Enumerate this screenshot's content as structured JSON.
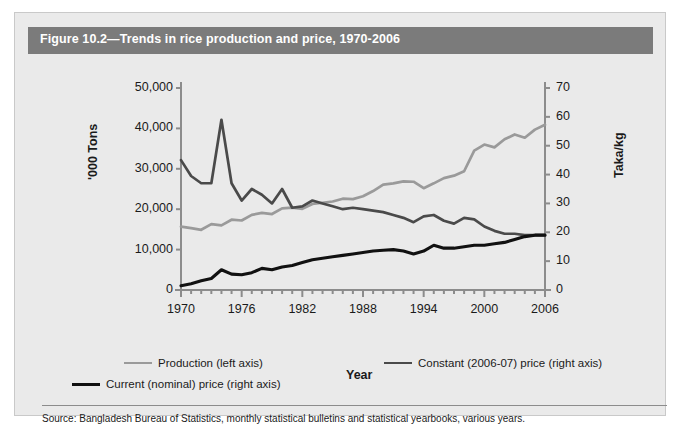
{
  "figure": {
    "title": "Figure 10.2—Trends in rice production and price, 1970-2006",
    "source": "Source: Bangladesh Bureau of Statistics, monthly statistical bulletins and statistical yearbooks, various years."
  },
  "legend": {
    "production": "Production (left axis)",
    "constant": "Constant (2006-07) price (right axis)",
    "current": "Current (nominal) price (right axis)"
  },
  "colors": {
    "title_bar": "#7b7b7b",
    "panel_bg": "#eaeaea",
    "production": "#9a9a9a",
    "constant": "#4a4a4a",
    "current": "#111111",
    "axis": "#8c8c8c"
  },
  "chart_data": {
    "type": "line",
    "title": "Figure 10.2—Trends in rice production and price, 1970-2006",
    "xlabel": "Year",
    "ylabel": "'000 Tons",
    "ylabel_right": "Taka/kg",
    "grid": false,
    "legend_position": "bottom",
    "xlim": [
      1970,
      2006
    ],
    "ylim": [
      0,
      50000
    ],
    "ylim_right": [
      0,
      70
    ],
    "xticks": [
      1970,
      1976,
      1982,
      1988,
      1994,
      2000,
      2006
    ],
    "xtick_labels": [
      "1970",
      "1976",
      "1982",
      "1988",
      "1994",
      "2000",
      "2006"
    ],
    "yticks": [
      0,
      10000,
      20000,
      30000,
      40000,
      50000
    ],
    "ytick_labels": [
      "0",
      "10,000",
      "20,000",
      "30,000",
      "40,000",
      "50,000"
    ],
    "yticks_right": [
      0,
      10,
      20,
      30,
      40,
      50,
      60,
      70
    ],
    "ytick_labels_right": [
      "0",
      "10",
      "20",
      "30",
      "40",
      "50",
      "60",
      "70"
    ],
    "x": [
      1970,
      1971,
      1972,
      1973,
      1974,
      1975,
      1976,
      1977,
      1978,
      1979,
      1980,
      1981,
      1982,
      1983,
      1984,
      1985,
      1986,
      1987,
      1988,
      1989,
      1990,
      1991,
      1992,
      1993,
      1994,
      1995,
      1996,
      1997,
      1998,
      1999,
      2000,
      2001,
      2002,
      2003,
      2004,
      2005,
      2006
    ],
    "series": [
      {
        "name": "Production (left axis)",
        "axis": "left",
        "unit": "'000 Tons",
        "color": "#9a9a9a",
        "values": [
          15700,
          15300,
          14900,
          16300,
          16000,
          17400,
          17200,
          18600,
          19100,
          18800,
          20200,
          20400,
          20100,
          21300,
          21600,
          21900,
          22600,
          22500,
          23200,
          24500,
          26100,
          26400,
          26900,
          26800,
          25200,
          26400,
          27700,
          28300,
          29400,
          34500,
          36000,
          35300,
          37300,
          38500,
          37700,
          39700,
          40900
        ]
      },
      {
        "name": "Constant (2006-07) price (right axis)",
        "axis": "right",
        "unit": "Taka/kg",
        "color": "#4a4a4a",
        "values": [
          45,
          39.5,
          37,
          37,
          59,
          37,
          31,
          35,
          33,
          30,
          35,
          28.5,
          29,
          31,
          30,
          29,
          28,
          28.5,
          28,
          27.5,
          27,
          26,
          25,
          23.5,
          25.5,
          26,
          24,
          23,
          25,
          24.5,
          22,
          20.5,
          19.5,
          19.5,
          19,
          19,
          19
        ]
      },
      {
        "name": "Current (nominal) price (right axis)",
        "axis": "right",
        "unit": "Taka/kg",
        "color": "#111111",
        "values": [
          1.5,
          2.2,
          3.2,
          4,
          7,
          5.5,
          5.3,
          6,
          7.5,
          7,
          8,
          8.5,
          9.5,
          10.5,
          11,
          11.5,
          12,
          12.5,
          13,
          13.5,
          13.8,
          14,
          13.5,
          12.5,
          13.5,
          15.5,
          14.5,
          14.5,
          15,
          15.5,
          15.5,
          16,
          16.5,
          17.5,
          18.5,
          19,
          19
        ]
      }
    ]
  }
}
